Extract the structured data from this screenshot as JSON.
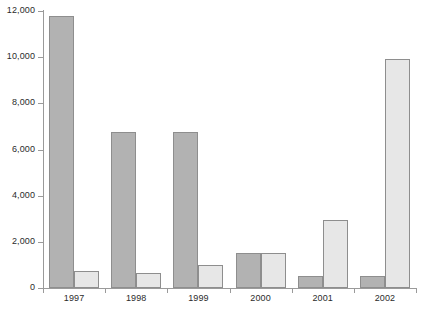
{
  "chart_data": {
    "type": "bar",
    "title": "",
    "subtitle": "",
    "xlabel": "",
    "ylabel": "",
    "categories": [
      "1997",
      "1998",
      "1999",
      "2000",
      "2001",
      "2002"
    ],
    "series": [
      {
        "name": "Series 1",
        "color": "#b2b2b2",
        "values": [
          11800,
          6750,
          6750,
          1500,
          520,
          510
        ]
      },
      {
        "name": "Series 2",
        "color": "#e7e7e7",
        "values": [
          740,
          650,
          1000,
          1500,
          2950,
          9920
        ]
      }
    ],
    "ylim": [
      0,
      12000
    ],
    "ytick_values": [
      0,
      2000,
      4000,
      6000,
      8000,
      10000,
      12000
    ],
    "ytick_labels": [
      "0",
      "2,000",
      "4,000",
      "6,000",
      "8,000",
      "10,000",
      "12,000"
    ],
    "grid": false,
    "legend": "none",
    "axis_color": "#9a9a9a",
    "bar_border_color": "#8e8e8e",
    "text_color": "#2b2b2b",
    "background": "#ffffff"
  }
}
